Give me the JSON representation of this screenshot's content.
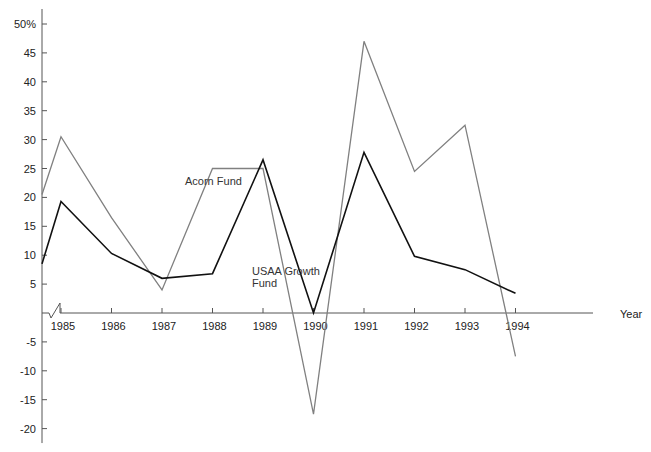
{
  "chart_data": {
    "type": "line",
    "title": "",
    "xlabel": "Year",
    "ylabel": "",
    "x": [
      "1985",
      "1986",
      "1987",
      "1988",
      "1989",
      "1990",
      "1991",
      "1992",
      "1993",
      "1994"
    ],
    "start_values": {
      "Acorn Fund": 20.5,
      "USAA Growth Fund": 8.5
    },
    "series": [
      {
        "name": "Acorn Fund",
        "color": "#808080",
        "values": [
          30.5,
          16.5,
          4,
          25,
          25,
          -17.5,
          47,
          24.5,
          32.5,
          -7.5
        ]
      },
      {
        "name": "USAA Growth Fund",
        "color": "#111111",
        "values": [
          19.3,
          10.3,
          6,
          6.8,
          26.5,
          0,
          27.8,
          9.8,
          7.5,
          3.4
        ]
      }
    ],
    "yticks": [
      "50%",
      "45",
      "40",
      "35",
      "30",
      "25",
      "20",
      "15",
      "10",
      "5",
      "-5",
      "-10",
      "-15",
      "-20"
    ],
    "ytick_values": [
      50,
      45,
      40,
      35,
      30,
      25,
      20,
      15,
      10,
      5,
      -5,
      -10,
      -15,
      -20
    ],
    "ylim": [
      -22,
      52
    ],
    "grid": false,
    "legend": "inline labels",
    "axis_break": true
  },
  "labels": {
    "acorn": "Acorn Fund",
    "usaa_line1": "USAA Growth",
    "usaa_line2": "Fund",
    "x_axis_title": "Year"
  }
}
